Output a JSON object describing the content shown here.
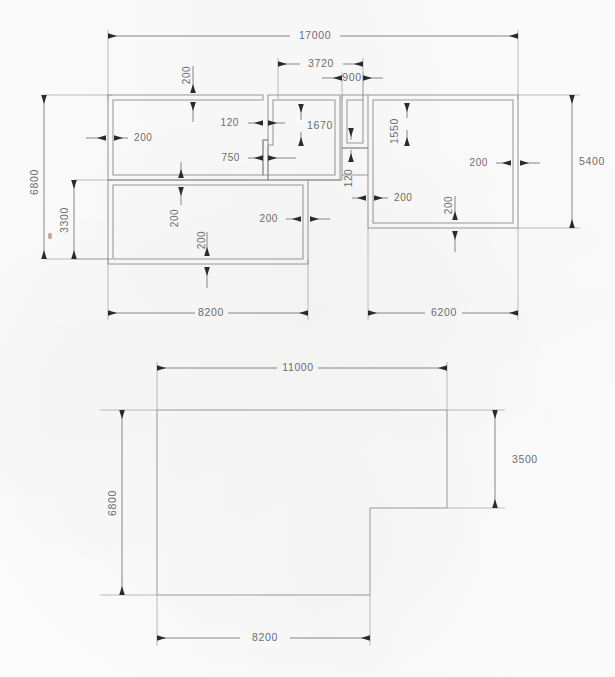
{
  "drawing": {
    "title": "Architectural floor plan dimension drawing",
    "units": "mm",
    "line_color": "#8a8a8a",
    "wall_color": "#9a9a9a",
    "dim_color": "#5f5f5f",
    "text_color": "#6e6e72",
    "background": "#fdfdfd"
  },
  "plan_upper": {
    "name": "walled-floor-plan",
    "overall_width": "17000",
    "overall_height": "6800",
    "dimensions": {
      "overall_length": "17000",
      "left_block_length": "8200",
      "right_block_length": "6200",
      "middle_offset": "3720",
      "closet_width": "900",
      "overall_depth": "6800",
      "right_depth": "5400",
      "lower_left_depth": "3300",
      "upper_mid_depth": "1670",
      "right_upper_depth": "1550",
      "jog_width": "120",
      "jog_width_2": "120",
      "step_length": "750"
    },
    "wall_thickness_labels": [
      {
        "id": "w-top-left",
        "value": "200",
        "orient": "vertical"
      },
      {
        "id": "w-left",
        "value": "200",
        "orient": "horizontal"
      },
      {
        "id": "w-mid-horiz",
        "value": "200",
        "orient": "vertical"
      },
      {
        "id": "w-mid-lower",
        "value": "200",
        "orient": "vertical"
      },
      {
        "id": "w-lowleft-right",
        "value": "200",
        "orient": "horizontal"
      },
      {
        "id": "w-right-left",
        "value": "200",
        "orient": "horizontal"
      },
      {
        "id": "w-right-right",
        "value": "200",
        "orient": "horizontal"
      },
      {
        "id": "w-right-bottom",
        "value": "200",
        "orient": "vertical"
      }
    ]
  },
  "plan_lower": {
    "name": "outline-floor-plan",
    "dimensions": {
      "top_length": "11000",
      "bottom_length": "8200",
      "left_depth": "6800",
      "right_depth": "3500"
    }
  }
}
